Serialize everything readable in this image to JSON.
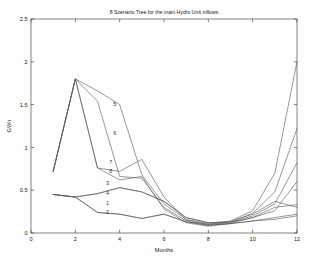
{
  "chart_data": {
    "type": "line",
    "title": "8 Scenario Tree for the main Hydro Unit inflows",
    "xlabel": "Months",
    "ylabel": "GWh",
    "xlim": [
      0,
      12
    ],
    "ylim": [
      0,
      2.5
    ],
    "xticks": [
      0,
      2,
      4,
      6,
      8,
      10,
      12
    ],
    "yticks": [
      0,
      0.5,
      1,
      1.5,
      2,
      2.5
    ],
    "xtick_labels": [
      "0",
      "2",
      "4",
      "6",
      "8",
      "10",
      "12"
    ],
    "ytick_labels": [
      "0",
      "0.5",
      "1",
      "1.5",
      "2",
      "2.5"
    ],
    "grid": false,
    "legend": "none",
    "line_color": "#595959",
    "background": "#ffffff",
    "axis_color": "#4d4d4d",
    "x": [
      1,
      2,
      3,
      4,
      5,
      6,
      7,
      8,
      9,
      10,
      11,
      12
    ],
    "series": [
      {
        "name": "1",
        "label": "1",
        "label_x": 3.45,
        "label_y": 0.33,
        "values": [
          0.45,
          0.42,
          0.24,
          0.22,
          0.17,
          0.22,
          0.13,
          0.09,
          0.11,
          0.14,
          0.16,
          0.2
        ]
      },
      {
        "name": "2",
        "label": "2",
        "label_x": 3.45,
        "label_y": 0.22,
        "values": [
          0.45,
          0.42,
          0.24,
          0.22,
          0.17,
          0.22,
          0.13,
          0.09,
          0.11,
          0.14,
          0.18,
          0.22
        ]
      },
      {
        "name": "3",
        "label": "3",
        "label_x": 3.45,
        "label_y": 0.56,
        "values": [
          0.45,
          0.42,
          0.46,
          0.53,
          0.48,
          0.37,
          0.18,
          0.12,
          0.13,
          0.18,
          0.3,
          0.33
        ]
      },
      {
        "name": "4",
        "label": "4",
        "label_x": 3.45,
        "label_y": 0.44,
        "values": [
          0.45,
          0.42,
          0.46,
          0.53,
          0.48,
          0.37,
          0.18,
          0.12,
          0.13,
          0.22,
          0.37,
          0.3
        ]
      },
      {
        "name": "5",
        "label": "5",
        "label_x": 3.78,
        "label_y": 1.48,
        "values": [
          0.72,
          1.8,
          1.66,
          1.5,
          0.68,
          0.34,
          0.16,
          0.11,
          0.14,
          0.26,
          0.7,
          2.0
        ]
      },
      {
        "name": "6",
        "label": "6",
        "label_x": 3.78,
        "label_y": 1.14,
        "values": [
          0.72,
          1.8,
          1.54,
          0.66,
          0.64,
          0.3,
          0.14,
          0.1,
          0.13,
          0.23,
          0.48,
          1.22
        ]
      },
      {
        "name": "7",
        "label": "7",
        "label_x": 3.6,
        "label_y": 0.81,
        "values": [
          0.72,
          1.8,
          0.76,
          0.72,
          0.86,
          0.42,
          0.15,
          0.1,
          0.12,
          0.2,
          0.34,
          0.82
        ]
      },
      {
        "name": "8",
        "label": "8",
        "label_x": 3.6,
        "label_y": 0.7,
        "values": [
          0.72,
          1.8,
          0.76,
          0.62,
          0.66,
          0.28,
          0.12,
          0.08,
          0.11,
          0.18,
          0.26,
          0.6
        ]
      }
    ],
    "peak": {
      "month": 2,
      "value": 1.8
    },
    "min_region": {
      "month": 8,
      "value": 0.08
    }
  }
}
